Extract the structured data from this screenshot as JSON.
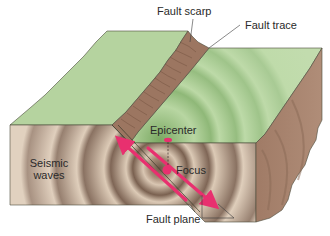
{
  "diagram": {
    "labels": {
      "fault_scarp": "Fault scarp",
      "fault_trace": "Fault trace",
      "epicenter": "Epicenter",
      "focus": "Focus",
      "seismic_waves_line1": "Seismic",
      "seismic_waves_line2": "waves",
      "fault_plane": "Fault plane"
    },
    "colors": {
      "surface_green": "#b5d39f",
      "surface_green_dark": "#9fc488",
      "scarp_brown": "#9c7661",
      "front_tan": "#dccab6",
      "side_brown": "#a5806a",
      "wave_dark": "#7d6654",
      "arrow_pink": "#e8306f",
      "outline": "#4a4a3a"
    }
  }
}
